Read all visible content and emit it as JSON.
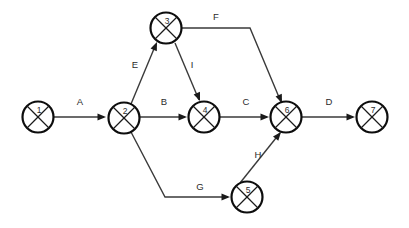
{
  "diagram": {
    "type": "activity-on-arrow-network",
    "canvas": {
      "width": 409,
      "height": 228,
      "background": "#ffffff"
    },
    "style": {
      "node_stroke": "#0d0d0d",
      "node_fill": "#ffffff",
      "edge_stroke": "#3a3a3a",
      "label_color": "#2b2b2b",
      "node_radius": 15.5
    },
    "nodes": [
      {
        "id": "n1",
        "label": "1",
        "cx": 38,
        "cy": 117,
        "r": 15.5
      },
      {
        "id": "n2",
        "label": "2",
        "cx": 124,
        "cy": 118,
        "r": 15.5
      },
      {
        "id": "n3",
        "label": "3",
        "cx": 166,
        "cy": 28,
        "r": 15.5
      },
      {
        "id": "n4",
        "label": "4",
        "cx": 204,
        "cy": 117,
        "r": 15.5
      },
      {
        "id": "n5",
        "label": "5",
        "cx": 247,
        "cy": 197,
        "r": 15.5
      },
      {
        "id": "n6",
        "label": "6",
        "cx": 286,
        "cy": 117,
        "r": 15.5
      },
      {
        "id": "n7",
        "label": "7",
        "cx": 372,
        "cy": 117,
        "r": 15.5
      }
    ],
    "edges": [
      {
        "id": "eA",
        "label": "A",
        "from": "n1",
        "to": "n2",
        "path": "M 54 117 L 104 117",
        "label_x": 80,
        "label_y": 102
      },
      {
        "id": "eE",
        "label": "E",
        "from": "n2",
        "to": "n3",
        "path": "M 131 104 L 156 44",
        "label_x": 135,
        "label_y": 65
      },
      {
        "id": "eB",
        "label": "B",
        "from": "n2",
        "to": "n4",
        "path": "M 140 117 L 185 117",
        "label_x": 164,
        "label_y": 102
      },
      {
        "id": "eI",
        "label": "I",
        "from": "n3",
        "to": "n4",
        "path": "M 175 43 L 199 100",
        "label_x": 192,
        "label_y": 65
      },
      {
        "id": "eF",
        "label": "F",
        "from": "n3",
        "to": "n6",
        "path": "M 182 28 L 250 28 L 281 102",
        "label_x": 216,
        "label_y": 17
      },
      {
        "id": "eC",
        "label": "C",
        "from": "n4",
        "to": "n6",
        "path": "M 220 117 L 267 117",
        "label_x": 246,
        "label_y": 102
      },
      {
        "id": "eG",
        "label": "G",
        "from": "n2",
        "to": "n5",
        "path": "M 131 132 L 165 197 L 228 197",
        "label_x": 200,
        "label_y": 187
      },
      {
        "id": "eH",
        "label": "H",
        "from": "n5",
        "to": "n6",
        "path": "M 240 183 L 280 133",
        "label_x": 258,
        "label_y": 155
      },
      {
        "id": "eD",
        "label": "D",
        "from": "n6",
        "to": "n7",
        "path": "M 302 117 L 353 117",
        "label_x": 329,
        "label_y": 102
      }
    ],
    "arrowheads": [
      {
        "id": "aA",
        "for": "eA",
        "x": 106,
        "y": 117,
        "angle": 0
      },
      {
        "id": "aE",
        "for": "eE",
        "x": 157,
        "y": 42,
        "angle": -67
      },
      {
        "id": "aB",
        "for": "eB",
        "x": 187,
        "y": 117,
        "angle": 0
      },
      {
        "id": "aI",
        "for": "eI",
        "x": 200,
        "y": 101,
        "angle": 68
      },
      {
        "id": "aF",
        "for": "eF",
        "x": 282,
        "y": 103,
        "angle": 67
      },
      {
        "id": "aC",
        "for": "eC",
        "x": 269,
        "y": 117,
        "angle": 0
      },
      {
        "id": "aG",
        "for": "eG",
        "x": 230,
        "y": 197,
        "angle": 0
      },
      {
        "id": "aH",
        "for": "eH",
        "x": 281,
        "y": 132,
        "angle": -51
      },
      {
        "id": "aD",
        "for": "eD",
        "x": 355,
        "y": 117,
        "angle": 0
      }
    ]
  }
}
